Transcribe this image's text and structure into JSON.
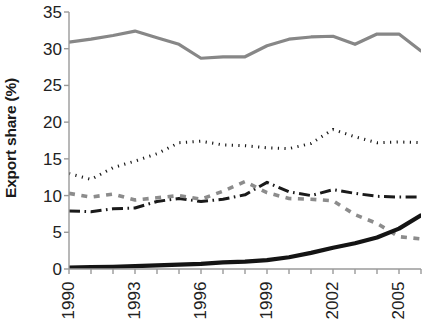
{
  "chart_data": {
    "type": "line",
    "title": "",
    "xlabel": "",
    "ylabel": "Export share (%)",
    "ylim": [
      0,
      35
    ],
    "xlim": [
      1990,
      2006
    ],
    "grid": false,
    "legend": "none",
    "y_ticks": [
      35,
      30,
      25,
      20,
      15,
      10,
      5,
      0
    ],
    "x_ticks": [
      1990,
      1991,
      1992,
      1993,
      1994,
      1995,
      1996,
      1997,
      1998,
      1999,
      2000,
      2001,
      2002,
      2003,
      2004,
      2005,
      2006
    ],
    "x_tick_labels": [
      "1990",
      "1993",
      "1996",
      "1999",
      "2002",
      "2005"
    ],
    "x_tick_label_years": [
      1990,
      1993,
      1996,
      1999,
      2002,
      2005
    ],
    "x": [
      1990,
      1991,
      1992,
      1993,
      1994,
      1995,
      1996,
      1997,
      1998,
      1999,
      2000,
      2001,
      2002,
      2003,
      2004,
      2005,
      2006
    ],
    "series": [
      {
        "name": "series-gray-solid-top",
        "style": "solid",
        "color": "#878787",
        "width": 3.2,
        "values": [
          30.9,
          31.3,
          31.8,
          32.4,
          31.5,
          30.6,
          28.7,
          28.9,
          28.9,
          30.4,
          31.3,
          31.6,
          31.7,
          30.6,
          32.0,
          32.0,
          29.7
        ]
      },
      {
        "name": "series-black-dotted",
        "style": "dotted",
        "color": "#1a1a1a",
        "width": 3.0,
        "values": [
          13.0,
          12.2,
          13.8,
          14.7,
          15.7,
          17.2,
          17.4,
          16.9,
          16.8,
          16.5,
          16.4,
          17.1,
          19.0,
          18.0,
          17.2,
          17.3,
          17.2
        ]
      },
      {
        "name": "series-black-dash-dot",
        "style": "dash-dot",
        "color": "#1a1a1a",
        "width": 3.0,
        "values": [
          7.9,
          7.8,
          8.2,
          8.3,
          9.2,
          9.6,
          9.2,
          9.5,
          10.1,
          11.8,
          10.5,
          10.0,
          10.8,
          10.3,
          9.9,
          9.8,
          9.8
        ]
      },
      {
        "name": "series-gray-dashed",
        "style": "dashed",
        "color": "#8c8c8c",
        "width": 3.6,
        "values": [
          10.3,
          9.8,
          10.2,
          9.4,
          9.7,
          10.0,
          9.5,
          10.6,
          11.9,
          10.4,
          9.6,
          9.5,
          9.3,
          7.4,
          6.2,
          4.4,
          4.1
        ]
      },
      {
        "name": "series-black-solid-thick",
        "style": "solid",
        "color": "#141414",
        "width": 4.2,
        "values": [
          0.2,
          0.25,
          0.3,
          0.4,
          0.5,
          0.6,
          0.7,
          0.9,
          1.0,
          1.2,
          1.6,
          2.2,
          2.9,
          3.5,
          4.3,
          5.5,
          7.3
        ]
      }
    ]
  }
}
